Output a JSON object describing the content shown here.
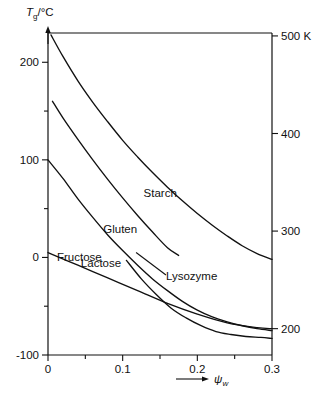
{
  "chart_data": {
    "type": "line",
    "title": "",
    "subtitle": "",
    "xlabel": "ψw",
    "xlabel_prefix": "→",
    "ylabel": "Tg/°C",
    "ylabel_arrow": "↑",
    "y2label": "500 K",
    "xlim": [
      0,
      0.3
    ],
    "ylim": [
      -100,
      230
    ],
    "y2lim": [
      173,
      503
    ],
    "grid": false,
    "legend": "inline-labels",
    "xticks": [
      "0",
      "0.1",
      "0.2",
      "0.3"
    ],
    "xtick_values": [
      0,
      0.1,
      0.2,
      0.3
    ],
    "xminor_values": [
      0.05,
      0.15,
      0.25
    ],
    "yticks": [
      "200",
      "100",
      "0",
      "-100"
    ],
    "ytick_values": [
      200,
      100,
      0,
      -100
    ],
    "yminor_values": [
      150,
      50,
      -50
    ],
    "y2ticks": [
      "500 K",
      "400",
      "300",
      "200"
    ],
    "y2tick_values": [
      500,
      400,
      300,
      200
    ],
    "series": [
      {
        "name": "Starch",
        "label": "Starch",
        "label_x": 0.128,
        "label_y": 62,
        "x": [
          0.004,
          0.02,
          0.04,
          0.06,
          0.08,
          0.1,
          0.12,
          0.14,
          0.16,
          0.18,
          0.2,
          0.22,
          0.24,
          0.26,
          0.28,
          0.3
        ],
        "y": [
          228,
          206,
          181,
          159,
          139,
          120,
          103,
          87,
          72,
          58,
          45,
          33,
          22,
          12,
          4,
          -2
        ]
      },
      {
        "name": "Gluten",
        "label": "Gluten",
        "label_x": 0.074,
        "label_y": 25,
        "x": [
          0.006,
          0.02,
          0.04,
          0.06,
          0.08,
          0.1,
          0.12,
          0.14,
          0.16,
          0.175
        ],
        "y": [
          160,
          143,
          121,
          100,
          80,
          61,
          43,
          26,
          10,
          2
        ]
      },
      {
        "name": "Lactose",
        "label": "Lactose",
        "label_x": 0.044,
        "label_y": -10,
        "x": [
          0.0,
          0.02,
          0.04,
          0.06,
          0.08,
          0.1,
          0.12,
          0.14,
          0.16,
          0.18,
          0.2,
          0.22,
          0.24,
          0.26,
          0.28,
          0.3
        ],
        "y": [
          100,
          81,
          60,
          41,
          23,
          7,
          -8,
          -22,
          -34,
          -45,
          -54,
          -61,
          -66,
          -70,
          -73,
          -75
        ]
      },
      {
        "name": "Fructose",
        "label": "Fructose",
        "label_x": 0.012,
        "label_y": -4,
        "x": [
          0.0,
          0.04,
          0.08,
          0.12,
          0.16,
          0.2,
          0.24,
          0.28,
          0.3
        ],
        "y": [
          5,
          -8,
          -21,
          -34,
          -47,
          -58,
          -67,
          -72,
          -73
        ]
      },
      {
        "name": "Lysozyme",
        "label": "Lysozyme",
        "label_x": 0.158,
        "label_y": -23,
        "x": [
          0.105,
          0.125,
          0.145,
          0.165,
          0.185,
          0.205,
          0.225,
          0.245,
          0.265,
          0.285,
          0.3
        ],
        "y": [
          -3,
          -22,
          -38,
          -52,
          -62,
          -70,
          -76,
          -79,
          -81,
          -82,
          -83
        ]
      }
    ],
    "annotations": [
      {
        "name": "lysozyme-leader",
        "x1": 0.158,
        "y1": -18,
        "x2": 0.118,
        "y2": 5
      }
    ]
  }
}
